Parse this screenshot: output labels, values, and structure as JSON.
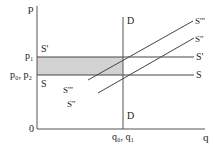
{
  "diagram": {
    "type": "supply-demand",
    "axes": {
      "y_label": "p",
      "x_label": "q",
      "origin_label": "0"
    },
    "price_levels": [
      {
        "label": "p₁",
        "name": "p1"
      },
      {
        "label": "p₀, p₂",
        "name": "p0-p2"
      }
    ],
    "quantity_levels": [
      {
        "label": "q₀, q₁",
        "name": "q0-q1"
      }
    ],
    "demand": {
      "top_label": "D",
      "bottom_label": "D"
    },
    "supply_curves": [
      {
        "name": "S",
        "left_label": "S",
        "right_label": "S",
        "kind": "horizontal"
      },
      {
        "name": "S'",
        "left_label": "S'",
        "right_label": "S'",
        "kind": "horizontal"
      },
      {
        "name": "S''",
        "left_label": "S''",
        "right_label": "S''",
        "kind": "upward"
      },
      {
        "name": "S'''",
        "left_label": "S'''",
        "right_label": "S'''",
        "kind": "upward"
      }
    ],
    "shaded_area_color": "#d3d3d3",
    "line_color": "#444444"
  }
}
